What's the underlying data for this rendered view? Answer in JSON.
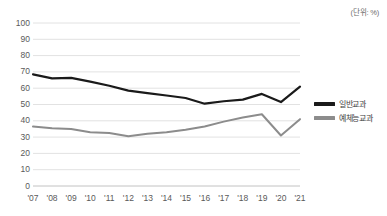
{
  "unit_note": "(단위: %)",
  "legend": {
    "position": "right",
    "items": [
      {
        "label": "일반교과",
        "color": "#1a1a1a"
      },
      {
        "label": "예체능교과",
        "color": "#8c8c8c"
      }
    ]
  },
  "axis": {
    "y_ticks": [
      "100",
      "90",
      "80",
      "70",
      "60",
      "50",
      "40",
      "30",
      "20",
      "10",
      "0"
    ],
    "x_ticks": [
      "'07",
      "'08",
      "'09",
      "'10",
      "'11",
      "'12",
      "'13",
      "'14",
      "'15",
      "'16",
      "'17",
      "'18",
      "'19",
      "'20",
      "'21"
    ]
  },
  "chart_data": {
    "type": "line",
    "title": "",
    "subtitle": "",
    "xlabel": "",
    "ylabel": "",
    "unit": "%",
    "ylim": [
      0,
      100
    ],
    "ytick_step": 10,
    "grid": true,
    "legend_position": "right",
    "categories": [
      "'07",
      "'08",
      "'09",
      "'10",
      "'11",
      "'12",
      "'13",
      "'14",
      "'15",
      "'16",
      "'17",
      "'18",
      "'19",
      "'20",
      "'21"
    ],
    "series": [
      {
        "name": "일반교과",
        "color": "#1a1a1a",
        "values": [
          68.5,
          66.0,
          66.3,
          64.0,
          61.5,
          58.5,
          57.0,
          55.5,
          54.0,
          50.5,
          52.0,
          53.0,
          56.5,
          51.5,
          61.0
        ]
      },
      {
        "name": "예체능교과",
        "color": "#8c8c8c",
        "values": [
          36.5,
          35.5,
          35.0,
          33.0,
          32.5,
          30.5,
          32.0,
          33.0,
          34.5,
          36.5,
          39.5,
          42.0,
          44.0,
          31.0,
          41.0
        ]
      }
    ]
  }
}
